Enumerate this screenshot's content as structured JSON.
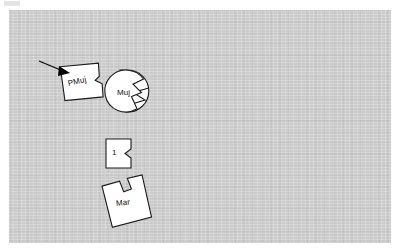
{
  "figure": {
    "background_color": "#ffffff",
    "panel_color": "#cbcbcb",
    "shape_fill": "#ffffff",
    "shape_stroke": "#1a1a1a",
    "annotation_color": "#000000"
  },
  "panel": {
    "x": 9,
    "y": 10,
    "width": 382,
    "height": 233
  },
  "shapes": [
    {
      "id": "shape-pmuj",
      "label": "PMuj",
      "kind": "notched-polygon",
      "rotation_deg": -13,
      "x": 61,
      "y": 57,
      "width": 44,
      "height": 49
    },
    {
      "id": "shape-muj",
      "label": "Muj",
      "kind": "wedge-circle",
      "rotation_deg": 0,
      "x": 107,
      "y": 70,
      "width": 42,
      "height": 42
    },
    {
      "id": "shape-one",
      "label": "1",
      "kind": "notched-square",
      "rotation_deg": 0,
      "x": 106,
      "y": 138,
      "width": 29,
      "height": 30
    },
    {
      "id": "shape-mar",
      "label": "Mar",
      "kind": "notched-polygon",
      "rotation_deg": -6,
      "x": 100,
      "y": 177,
      "width": 47,
      "height": 54
    }
  ],
  "annotations": [
    {
      "id": "pointer-arrow",
      "kind": "arrow",
      "points_to": "shape-pmuj",
      "from_x": 39,
      "from_y": 62,
      "to_x": 67,
      "to_y": 73
    }
  ]
}
